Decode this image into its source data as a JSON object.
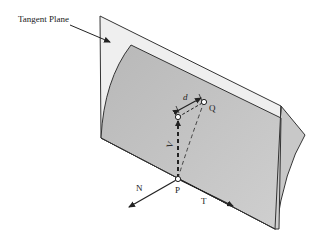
{
  "diagram": {
    "title_label": "Tangent Plane",
    "labels": {
      "point_p": "P",
      "point_q": "Q",
      "distance": "d",
      "vector_v": "V",
      "normal": "N",
      "tangent": "T"
    },
    "colors": {
      "background": "#ffffff",
      "plane_fill": "#eeeeee",
      "surface_fill": "#c4c4c4",
      "stroke": "#222222"
    }
  }
}
